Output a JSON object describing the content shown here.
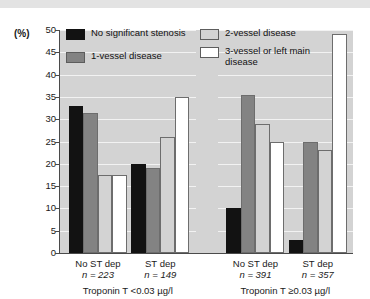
{
  "chart_data": {
    "type": "bar",
    "title": "",
    "xlabel": "",
    "ylabel": "(%)",
    "ylim": [
      0,
      50
    ],
    "yticks": [
      0,
      5,
      10,
      15,
      20,
      25,
      30,
      35,
      40,
      45,
      50
    ],
    "ytick_labels": [
      "0",
      "5",
      "10",
      "15",
      "20",
      "25",
      "30",
      "35",
      "40",
      "45",
      "50"
    ],
    "grid": true,
    "legend_position": "top-inside",
    "categories": [
      "No ST dep",
      "ST dep",
      "No ST dep",
      "ST dep"
    ],
    "category_counts": [
      "n = 223",
      "n = 149",
      "n = 391",
      "n = 357"
    ],
    "panels": [
      {
        "label": "Troponin T <0.03 µg/l",
        "categories": [
          "No ST dep",
          "ST dep"
        ]
      },
      {
        "label": "Troponin T ≥0.03 µg/l",
        "categories": [
          "No ST dep",
          "ST dep"
        ]
      }
    ],
    "series": [
      {
        "name": "No significant stenosis",
        "color": "#121212",
        "values": [
          33,
          20,
          10,
          3
        ]
      },
      {
        "name": "1-vessel disease",
        "color": "#838383",
        "values": [
          31.5,
          19,
          35.5,
          25
        ]
      },
      {
        "name": "2-vessel disease",
        "color": "#d3d3d3",
        "values": [
          17.5,
          26,
          29,
          23
        ]
      },
      {
        "name": "3-vessel or left main disease",
        "color": "#ffffff",
        "values": [
          17.5,
          35,
          25,
          49
        ]
      }
    ]
  },
  "legend": {
    "items": [
      {
        "label": "No significant stenosis",
        "swatch": "s0"
      },
      {
        "label": "2-vessel disease",
        "swatch": "s2"
      },
      {
        "label": "1-vessel disease",
        "swatch": "s1"
      },
      {
        "label": "3-vessel or left main disease",
        "swatch": "s3"
      }
    ]
  },
  "axis": {
    "unit_label": "(%)"
  }
}
